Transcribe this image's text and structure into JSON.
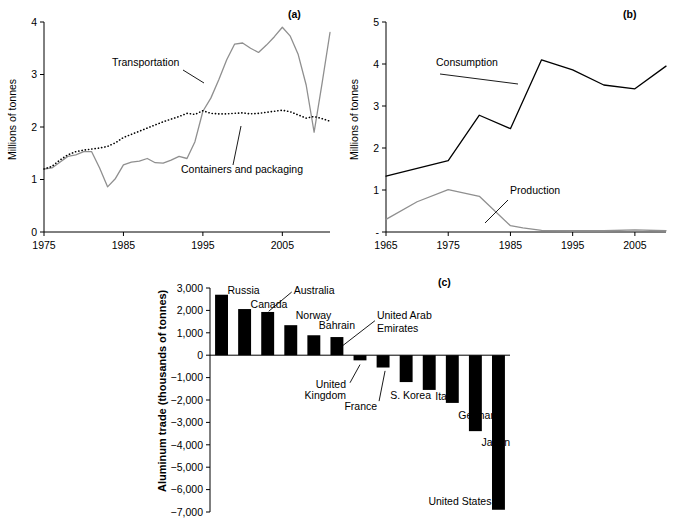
{
  "figure": {
    "panel_tags": {
      "a": "(a)",
      "b": "(b)",
      "c": "(c)"
    }
  },
  "chart_data": [
    {
      "type": "line",
      "panel": "(a)",
      "title": "",
      "xlabel": "",
      "ylabel": "Millions of tonnes",
      "xlim": [
        1975,
        2011
      ],
      "ylim": [
        0,
        4
      ],
      "xticks": [
        1975,
        1985,
        1995,
        2005
      ],
      "yticks": [
        0,
        1,
        2,
        3,
        4
      ],
      "grid": false,
      "legend_position": "inline-annotation",
      "series": [
        {
          "name": "Transportation",
          "style": "solid-gray",
          "color": "#8f8f8f",
          "x": [
            1975,
            1976,
            1977,
            1978,
            1979,
            1980,
            1981,
            1982,
            1983,
            1984,
            1985,
            1986,
            1987,
            1988,
            1989,
            1990,
            1991,
            1992,
            1993,
            1994,
            1995,
            1996,
            1997,
            1998,
            1999,
            2000,
            2001,
            2002,
            2003,
            2004,
            2005,
            2006,
            2007,
            2008,
            2009,
            2010,
            2011
          ],
          "values": [
            1.2,
            1.22,
            1.33,
            1.44,
            1.47,
            1.53,
            1.53,
            1.22,
            0.86,
            1.02,
            1.28,
            1.33,
            1.35,
            1.4,
            1.32,
            1.31,
            1.37,
            1.44,
            1.4,
            1.72,
            2.3,
            2.55,
            2.9,
            3.28,
            3.58,
            3.6,
            3.5,
            3.42,
            3.56,
            3.72,
            3.9,
            3.73,
            3.38,
            2.8,
            1.9,
            2.83,
            3.8
          ]
        },
        {
          "name": "Containers and packaging",
          "style": "dotted-black",
          "color": "#000000",
          "x": [
            1975,
            1976,
            1977,
            1978,
            1979,
            1980,
            1981,
            1982,
            1983,
            1984,
            1985,
            1986,
            1987,
            1988,
            1989,
            1990,
            1991,
            1992,
            1993,
            1994,
            1995,
            1996,
            1997,
            1998,
            1999,
            2000,
            2001,
            2002,
            2003,
            2004,
            2005,
            2006,
            2007,
            2008,
            2009,
            2010,
            2011
          ],
          "values": [
            1.2,
            1.25,
            1.37,
            1.47,
            1.53,
            1.56,
            1.58,
            1.6,
            1.63,
            1.7,
            1.8,
            1.86,
            1.92,
            1.98,
            2.04,
            2.1,
            2.15,
            2.2,
            2.26,
            2.24,
            2.31,
            2.26,
            2.25,
            2.25,
            2.26,
            2.27,
            2.25,
            2.26,
            2.28,
            2.3,
            2.32,
            2.29,
            2.23,
            2.17,
            2.2,
            2.16,
            2.11
          ]
        }
      ]
    },
    {
      "type": "line",
      "panel": "(b)",
      "title": "",
      "xlabel": "",
      "ylabel": "Millions of tonnes",
      "xlim": [
        1965,
        2010
      ],
      "ylim": [
        0,
        5
      ],
      "xticks": [
        1965,
        1975,
        1985,
        1995,
        2005
      ],
      "yticks": [
        0,
        1,
        2,
        3,
        4,
        5
      ],
      "ytick_labels": [
        "-",
        "1",
        "2",
        "3",
        "4",
        "5"
      ],
      "grid": false,
      "legend_position": "inline-annotation",
      "series": [
        {
          "name": "Consumption",
          "style": "solid-black",
          "color": "#000000",
          "x": [
            1965,
            1975,
            1980,
            1985,
            1990,
            1995,
            2000,
            2005,
            2010
          ],
          "values": [
            1.33,
            1.7,
            2.78,
            2.46,
            4.1,
            3.86,
            3.5,
            3.41,
            3.95
          ]
        },
        {
          "name": "Production",
          "style": "solid-gray",
          "color": "#8f8f8f",
          "x": [
            1965,
            1970,
            1975,
            1980,
            1985,
            1987,
            1990,
            1995,
            2000,
            2005,
            2010
          ],
          "values": [
            0.3,
            0.72,
            1.01,
            0.85,
            0.15,
            0.1,
            0.04,
            0.03,
            0.03,
            0.05,
            0.03
          ]
        }
      ]
    },
    {
      "type": "bar",
      "panel": "(c)",
      "title": "",
      "xlabel": "",
      "ylabel": "Aluminum trade (thousands of tonnes)",
      "ylim": [
        -7000,
        3000
      ],
      "yticks": [
        3000,
        2000,
        1000,
        0,
        -1000,
        -2000,
        -3000,
        -4000,
        -5000,
        -6000,
        -7000
      ],
      "ytick_labels": [
        "3,000",
        "2,000",
        "1,000",
        "0",
        "−1,000",
        "−2,000",
        "−3,000",
        "−4,000",
        "−5,000",
        "−6,000",
        "−7,000"
      ],
      "grid": false,
      "categories": [
        "Russia",
        "Canada",
        "Australia",
        "Norway",
        "Bahrain",
        "United Arab Emirates",
        "United Kingdom",
        "France",
        "S. Korea",
        "Italy",
        "Germany",
        "Japan",
        "United States"
      ],
      "values": [
        2700,
        2060,
        1930,
        1340,
        890,
        810,
        -230,
        -550,
        -1200,
        -1550,
        -2130,
        -3390,
        -6900
      ]
    }
  ]
}
